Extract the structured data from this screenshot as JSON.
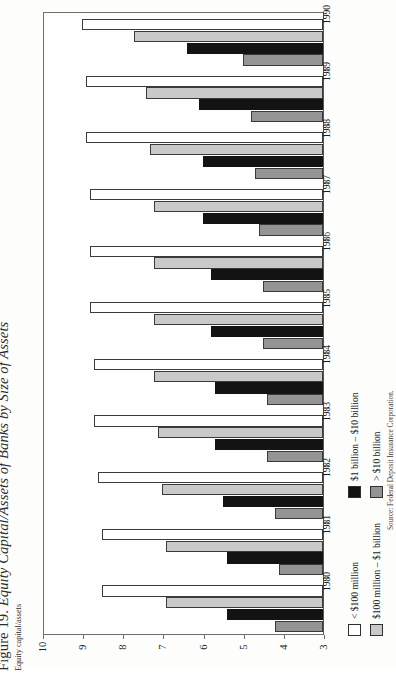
{
  "figure": {
    "number": "Figure 19.",
    "name": "Equity Capital/Assets of Banks by Size of Assets",
    "axis_title": "Equity capital/assets",
    "source": "Source: Federal Deposit Insurance Corporation."
  },
  "legend": {
    "position": "right",
    "items": [
      {
        "label": "< $100 million",
        "swatch": "sw-white",
        "color": "#ffffff"
      },
      {
        "label": "$100 million – $1 billion",
        "swatch": "sw-ltgray",
        "color": "#c9c9c9"
      },
      {
        "label": "$1 billion – $10 billion",
        "swatch": "sw-black",
        "color": "#131313"
      },
      {
        "label": "> $10 billion",
        "swatch": "sw-mdgray",
        "color": "#949494"
      }
    ]
  },
  "axis": {
    "ticks": [
      "10",
      "9",
      "8",
      "7",
      "6",
      "5",
      "4",
      "3"
    ],
    "min": 3,
    "max": 10,
    "reversed": true
  },
  "chart_data": {
    "type": "bar",
    "orientation": "horizontal",
    "title": "Figure 19. Equity Capital/Assets of Banks by Size of Assets",
    "subtitle": "Equity capital/assets",
    "xlabel": "",
    "ylabel": "Equity capital/assets",
    "ylim": [
      3,
      10
    ],
    "grid": false,
    "legend_position": "right",
    "categories": [
      "1980",
      "1981",
      "1982",
      "1983",
      "1984",
      "1985",
      "1986",
      "1987",
      "1988",
      "1989",
      "1990"
    ],
    "series": [
      {
        "name": "< $100 million",
        "color": "#ffffff",
        "values": [
          8.5,
          8.5,
          8.6,
          8.7,
          8.7,
          8.8,
          8.8,
          8.8,
          8.9,
          8.9,
          9.0
        ]
      },
      {
        "name": "$100 million – $1 billion",
        "color": "#c9c9c9",
        "values": [
          6.9,
          6.9,
          7.0,
          7.1,
          7.2,
          7.2,
          7.2,
          7.2,
          7.3,
          7.4,
          7.7
        ]
      },
      {
        "name": "$1 billion – $10 billion",
        "color": "#131313",
        "values": [
          5.4,
          5.4,
          5.5,
          5.7,
          5.7,
          5.8,
          5.8,
          6.0,
          6.0,
          6.1,
          6.4
        ]
      },
      {
        "name": "> $10 billion",
        "color": "#949494",
        "values": [
          4.2,
          4.1,
          4.2,
          4.4,
          4.4,
          4.5,
          4.5,
          4.6,
          4.7,
          4.8,
          5.0
        ]
      }
    ]
  }
}
